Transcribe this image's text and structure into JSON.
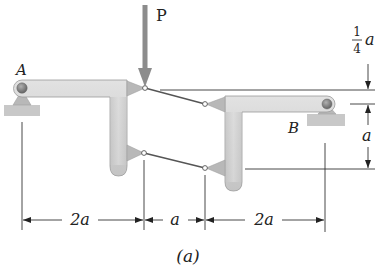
{
  "figure": {
    "caption": "(a)",
    "load_label": "P",
    "support_left_label": "A",
    "support_right_label": "B",
    "dimensions": {
      "horizontal": [
        "2a",
        "a",
        "2a"
      ],
      "vertical_top_numerator": "1",
      "vertical_top_denominator": "4",
      "vertical_top_unit": "a",
      "vertical_mid": "a"
    }
  },
  "colors": {
    "member_fill": "#d4d4d4",
    "member_stroke": "#9a9a9a",
    "gusset_fill": "#b8b8b8",
    "ground_fill": "#c8c8c8",
    "pin_fill": "#8a8a8a",
    "load_arrow": "#8c8c8c",
    "line": "#333333"
  }
}
